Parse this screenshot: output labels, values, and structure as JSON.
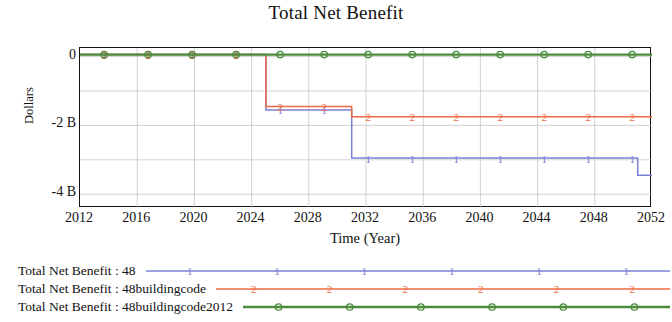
{
  "chart_data": {
    "type": "line",
    "title": "Total Net Benefit",
    "xlabel": "Time (Year)",
    "ylabel": "Dollars",
    "xlim": [
      2012,
      2052
    ],
    "ylim": [
      -4.4,
      0.25
    ],
    "xticks": [
      2012,
      2016,
      2020,
      2024,
      2028,
      2032,
      2036,
      2040,
      2044,
      2048,
      2052
    ],
    "yticks": [
      0,
      -2,
      -4
    ],
    "ytick_labels": [
      "0",
      "-2 B",
      "-4 B"
    ],
    "y_unit": "B",
    "grid": true,
    "grid_x_step": 4,
    "grid_y_step": 1,
    "legend_position": "below",
    "series": [
      {
        "name": "Total Net Benefit : 48",
        "marker": "1",
        "color": "#7b80d6",
        "x": [
          2012,
          2025,
          2025,
          2031,
          2031,
          2051,
          2051,
          2052
        ],
        "values": [
          0.06,
          0.06,
          -1.55,
          -1.55,
          -2.95,
          -2.95,
          -3.45,
          -3.45
        ]
      },
      {
        "name": "Total Net Benefit : 48buildingcode",
        "marker": "2",
        "color": "#ee6a45",
        "x": [
          2012,
          2025,
          2025,
          2031,
          2031,
          2052
        ],
        "values": [
          0.06,
          0.06,
          -1.45,
          -1.45,
          -1.75,
          -1.75
        ]
      },
      {
        "name": "Total Net Benefit : 48buildingcode2012",
        "marker": "3",
        "color": "#4c8c3c",
        "x": [
          2012,
          2052
        ],
        "values": [
          0.06,
          0.06
        ]
      }
    ]
  },
  "legend": {
    "items": [
      {
        "label": "Total Net Benefit : 48",
        "marker": "1",
        "color": "#7b80d6"
      },
      {
        "label": "Total Net Benefit : 48buildingcode",
        "marker": "2",
        "color": "#ee6a45"
      },
      {
        "label": "Total Net Benefit : 48buildingcode2012",
        "marker": "3",
        "color": "#4c8c3c"
      }
    ]
  }
}
